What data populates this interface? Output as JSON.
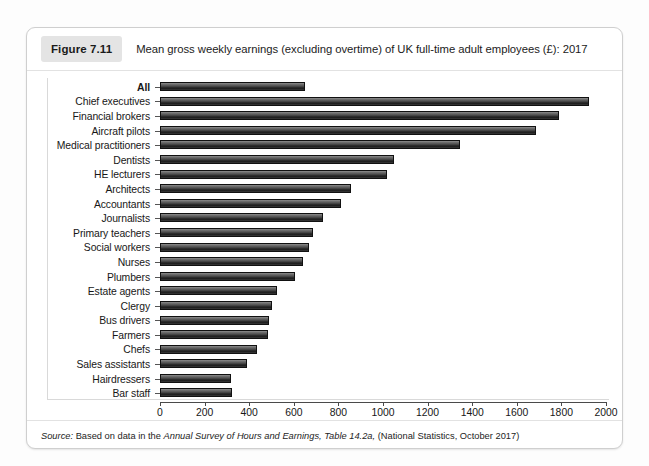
{
  "figure": {
    "tag": "Figure 7.11",
    "caption": "Mean gross weekly earnings (excluding overtime) of UK full-time adult employees (£): 2017",
    "source_prefix": "Source:",
    "source_part1": " Based on data in the ",
    "source_italic1": "Annual Survey of Hours and Earnings, Table 14.2a,",
    "source_part2": " (National Statistics, October 2017)"
  },
  "chart_data": {
    "type": "bar",
    "orientation": "horizontal",
    "title": "Mean gross weekly earnings (excluding overtime) of UK full-time adult employees (£): 2017",
    "xlabel": "",
    "ylabel": "",
    "xlim": [
      0,
      2000
    ],
    "xticks": [
      0,
      200,
      400,
      600,
      800,
      1000,
      1200,
      1400,
      1600,
      1800,
      2000
    ],
    "xtick_labels": [
      "0",
      "200",
      "400",
      "600",
      "800",
      "1000",
      "1200",
      "1400",
      "1600",
      "1800",
      "2000"
    ],
    "grid": false,
    "legend": null,
    "bar_color": "#2e2e2e",
    "categories": [
      "All",
      "Chief executives",
      "Financial brokers",
      "Aircraft pilots",
      "Medical practitioners",
      "Dentists",
      "HE lecturers",
      "Architects",
      "Accountants",
      "Journalists",
      "Primary teachers",
      "Social workers",
      "Nurses",
      "Plumbers",
      "Estate agents",
      "Clergy",
      "Bus drivers",
      "Farmers",
      "Chefs",
      "Sales assistants",
      "Hairdressers",
      "Bar staff"
    ],
    "values": [
      650,
      1925,
      1790,
      1685,
      1345,
      1050,
      1020,
      855,
      810,
      730,
      685,
      670,
      640,
      605,
      525,
      500,
      490,
      485,
      435,
      390,
      320,
      325
    ],
    "emphasis_index": 0
  },
  "rows": [
    {
      "label": "All",
      "value": 650,
      "bold": true
    },
    {
      "label": "Chief executives",
      "value": 1925,
      "bold": false
    },
    {
      "label": "Financial brokers",
      "value": 1790,
      "bold": false
    },
    {
      "label": "Aircraft pilots",
      "value": 1685,
      "bold": false
    },
    {
      "label": "Medical practitioners",
      "value": 1345,
      "bold": false
    },
    {
      "label": "Dentists",
      "value": 1050,
      "bold": false
    },
    {
      "label": "HE lecturers",
      "value": 1020,
      "bold": false
    },
    {
      "label": "Architects",
      "value": 855,
      "bold": false
    },
    {
      "label": "Accountants",
      "value": 810,
      "bold": false
    },
    {
      "label": "Journalists",
      "value": 730,
      "bold": false
    },
    {
      "label": "Primary teachers",
      "value": 685,
      "bold": false
    },
    {
      "label": "Social workers",
      "value": 670,
      "bold": false
    },
    {
      "label": "Nurses",
      "value": 640,
      "bold": false
    },
    {
      "label": "Plumbers",
      "value": 605,
      "bold": false
    },
    {
      "label": "Estate agents",
      "value": 525,
      "bold": false
    },
    {
      "label": "Clergy",
      "value": 500,
      "bold": false
    },
    {
      "label": "Bus drivers",
      "value": 490,
      "bold": false
    },
    {
      "label": "Farmers",
      "value": 485,
      "bold": false
    },
    {
      "label": "Chefs",
      "value": 435,
      "bold": false
    },
    {
      "label": "Sales assistants",
      "value": 390,
      "bold": false
    },
    {
      "label": "Hairdressers",
      "value": 320,
      "bold": false
    },
    {
      "label": "Bar staff",
      "value": 325,
      "bold": false
    }
  ]
}
